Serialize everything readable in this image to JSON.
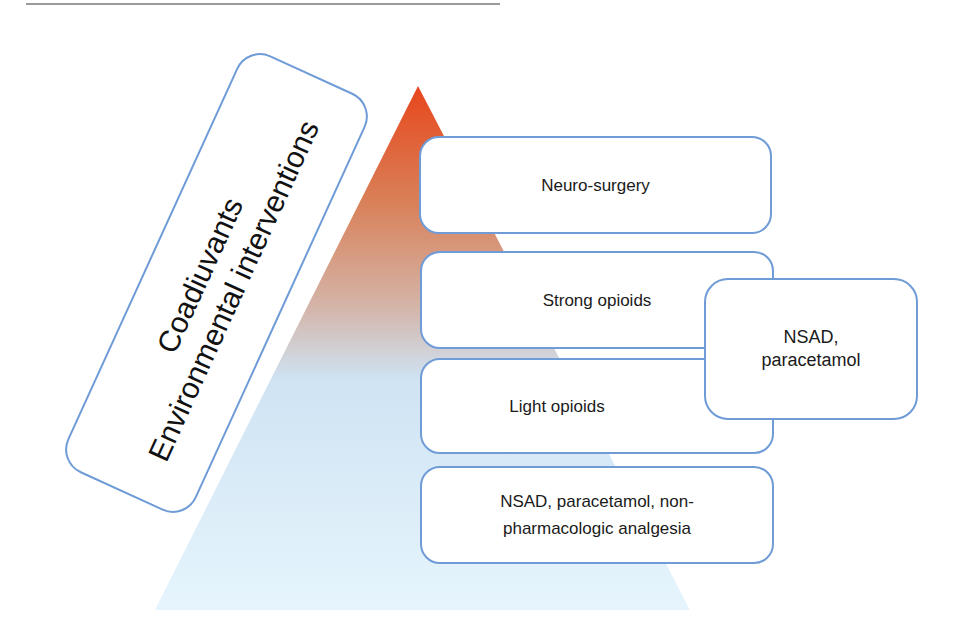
{
  "diagram": {
    "type": "analgesic-ladder-pyramid",
    "colors": {
      "box_border": "#6f9bd6",
      "pyramid_top": "#e8461c",
      "pyramid_middle": "#d38a6a",
      "pyramid_bottom": "#d6ecfb",
      "rule": "#9a9a9a"
    },
    "side_box": {
      "line1": "Coadiuvants",
      "line2": "Environmental interventions"
    },
    "steps": [
      {
        "label": "Neuro-surgery"
      },
      {
        "label": "Strong opioids"
      },
      {
        "label": "Light opioids"
      },
      {
        "label_line1": "NSAD, paracetamol, non-",
        "label_line2": "pharmacologic analgesia"
      }
    ],
    "adjunct_box": {
      "line1": "NSAD,",
      "line2": "paracetamol"
    }
  }
}
